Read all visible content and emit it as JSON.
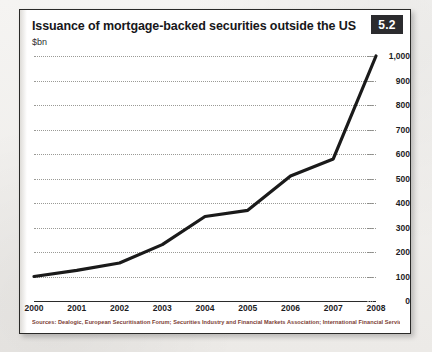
{
  "card": {
    "title": "Issuance of mortgage-backed securities outside the US",
    "subtitle": "$bn",
    "badge": "5.2",
    "source": "Sources: Dealogic, European Securitisation Forum; Securities Industry and Financial Markets Association; International Financial Services London"
  },
  "colors": {
    "line": "#1a1a1a",
    "badge_bg": "#2b2b2e",
    "grid": "#9a9a96",
    "source_text": "#7b3d33",
    "card_border": "#2a2a28"
  },
  "chart_data": {
    "type": "line",
    "title": "Issuance of mortgage-backed securities outside the US",
    "subtitle": "$bn",
    "xlabel": "",
    "ylabel": "$bn",
    "categories": [
      "2000",
      "2001",
      "2002",
      "2003",
      "2004",
      "2005",
      "2006",
      "2007",
      "2008"
    ],
    "values": [
      100,
      125,
      155,
      230,
      345,
      370,
      510,
      580,
      1000
    ],
    "series": [
      {
        "name": "Issuance of mortgage-backed securities outside the US",
        "values": [
          100,
          125,
          155,
          230,
          345,
          370,
          510,
          580,
          1000
        ]
      }
    ],
    "ylim": [
      0,
      1000
    ],
    "yticks": [
      0,
      100,
      200,
      300,
      400,
      500,
      600,
      700,
      800,
      900,
      1000
    ],
    "ytick_labels": [
      "0",
      "100",
      "200",
      "300",
      "400",
      "500",
      "600",
      "700",
      "800",
      "900",
      "1,000"
    ],
    "grid": true,
    "grid_style": "dotted-horizontal",
    "legend": false,
    "legend_position": "none",
    "ylabel_position": "right"
  }
}
